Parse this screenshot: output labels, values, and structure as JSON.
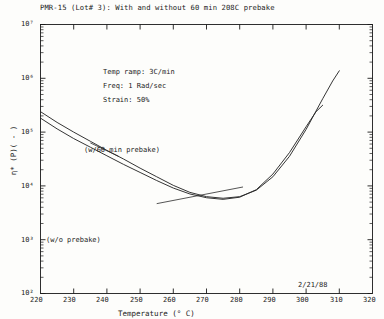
{
  "chart_data": {
    "type": "line",
    "title": "PMR-15 (Lot# 3): With and without 60 min 208C prebake",
    "xlabel": "Temperature (° C)",
    "ylabel": "η* (P)( - )",
    "xlim": [
      220,
      320
    ],
    "ylim_log10": [
      2,
      7
    ],
    "yscale": "log",
    "xticks": [
      "220",
      "230",
      "240",
      "250",
      "260",
      "270",
      "280",
      "290",
      "300",
      "310",
      "320"
    ],
    "yticks": [
      "10⁷",
      "10⁶",
      "10⁵",
      "10⁴",
      "10³",
      "10²"
    ],
    "ytick_exponents": [
      7,
      6,
      5,
      4,
      3,
      2
    ],
    "grid": false,
    "legend_position": "inline-annotation",
    "series": [
      {
        "name": "(w/60 min prebake)",
        "points": [
          [
            220,
            5.38
          ],
          [
            225,
            5.18
          ],
          [
            230,
            5.0
          ],
          [
            235,
            4.83
          ],
          [
            240,
            4.66
          ],
          [
            245,
            4.5
          ],
          [
            250,
            4.33
          ],
          [
            255,
            4.17
          ],
          [
            260,
            4.01
          ],
          [
            265,
            3.88
          ],
          [
            270,
            3.8
          ],
          [
            275,
            3.77
          ],
          [
            280,
            3.8
          ],
          [
            285,
            3.92
          ],
          [
            290,
            4.17
          ],
          [
            295,
            4.55
          ],
          [
            300,
            5.05
          ],
          [
            305,
            5.62
          ],
          [
            308,
            5.95
          ],
          [
            310,
            6.14
          ]
        ]
      },
      {
        "name": "(w/o prebake)",
        "points": [
          [
            220,
            5.26
          ],
          [
            225,
            5.06
          ],
          [
            230,
            4.88
          ],
          [
            235,
            4.72
          ],
          [
            240,
            4.56
          ],
          [
            245,
            4.4
          ],
          [
            250,
            4.25
          ],
          [
            255,
            4.1
          ],
          [
            260,
            3.96
          ],
          [
            265,
            3.85
          ],
          [
            270,
            3.78
          ],
          [
            275,
            3.75
          ],
          [
            280,
            3.79
          ],
          [
            285,
            3.93
          ],
          [
            290,
            4.22
          ],
          [
            295,
            4.62
          ],
          [
            300,
            5.1
          ],
          [
            303,
            5.38
          ],
          [
            305,
            5.5
          ]
        ]
      }
    ],
    "annotations": {
      "conditions": [
        "Temp ramp: 3C/min",
        "Freq: 1 Rad/sec",
        "Strain: 50%"
      ],
      "date_stamp": "2/21/88",
      "curve_labels": [
        "(w/60 min prebake)",
        "(w/o prebake)"
      ]
    },
    "colors": {
      "axis": "#1a1a1a",
      "curve": "#2a2a2a",
      "background": "#fdfdfb"
    }
  }
}
